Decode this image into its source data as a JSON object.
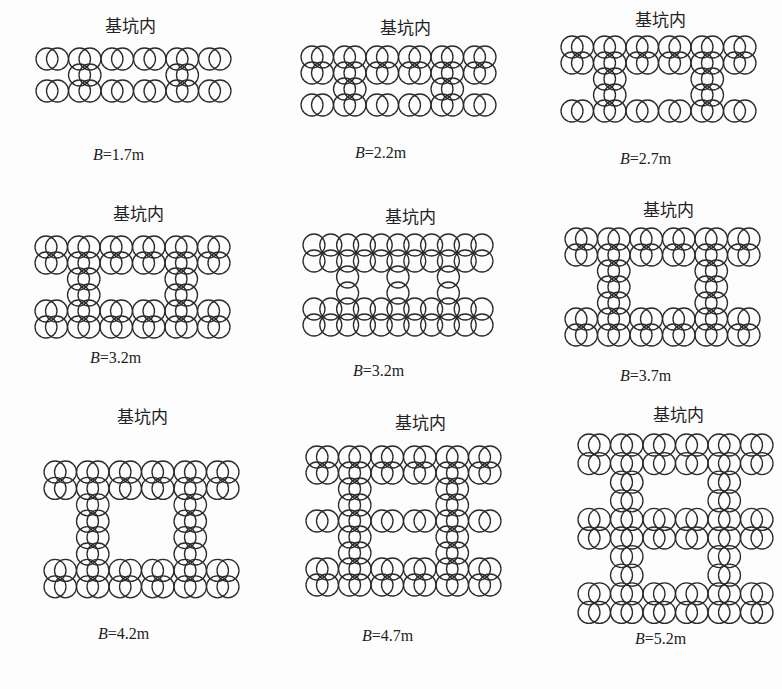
{
  "figure": {
    "inside_pit_label": "基坑内",
    "variable": "B",
    "panels": [
      {
        "id": "b17",
        "title": "基坑内",
        "title_pos": [
          130,
          16
        ],
        "b_value": "=1.7m",
        "label_pos": [
          93,
          146
        ],
        "layout": "horizontal",
        "origin": [
          35,
          47
        ],
        "row_step": 16,
        "rows": [
          "full",
          "conn",
          "full"
        ]
      },
      {
        "id": "b22",
        "title": "基坑内",
        "title_pos": [
          405,
          18
        ],
        "b_value": "=2.2m",
        "label_pos": [
          355,
          144
        ],
        "layout": "horizontal",
        "origin": [
          300,
          45
        ],
        "row_step": 16,
        "rows": [
          "full",
          "full",
          "conn",
          "full"
        ]
      },
      {
        "id": "b27",
        "title": "基坑内",
        "title_pos": [
          660,
          10
        ],
        "b_value": "=2.7m",
        "label_pos": [
          620,
          150
        ],
        "layout": "horizontal",
        "origin": [
          560,
          35
        ],
        "row_step": 16,
        "rows": [
          "full",
          "full",
          "conn",
          "conn",
          "full"
        ]
      },
      {
        "id": "b32a",
        "title": "基坑内",
        "title_pos": [
          138,
          204
        ],
        "b_value": "=3.2m",
        "label_pos": [
          90,
          349
        ],
        "layout": "horizontal",
        "origin": [
          34,
          235
        ],
        "row_step": 16,
        "rows": [
          "full",
          "full",
          "conn",
          "conn",
          "full",
          "full"
        ]
      },
      {
        "id": "b32b",
        "title": "基坑内",
        "title_pos": [
          410,
          207
        ],
        "b_value": "=3.2m",
        "label_pos": [
          353,
          362
        ],
        "layout": "vertical",
        "origin": [
          302,
          233
        ],
        "row_step": 16,
        "rows": [
          "full",
          "full",
          "conn",
          "conn",
          "full",
          "full"
        ]
      },
      {
        "id": "b37",
        "title": "基坑内",
        "title_pos": [
          668,
          200
        ],
        "b_value": "=3.7m",
        "label_pos": [
          620,
          367
        ],
        "layout": "horizontal",
        "origin": [
          564,
          227
        ],
        "row_step": 16,
        "rows": [
          "full",
          "full",
          "conn",
          "conn",
          "conn",
          "full",
          "full"
        ]
      },
      {
        "id": "b42",
        "title": "基坑内",
        "title_pos": [
          142,
          407
        ],
        "b_value": "=4.2m",
        "label_pos": [
          98,
          625
        ],
        "layout": "horizontal",
        "origin": [
          43,
          460
        ],
        "row_step": 16.4,
        "rows": [
          "full",
          "full",
          "conn",
          "conn",
          "conn",
          "conn",
          "full",
          "full"
        ]
      },
      {
        "id": "b47",
        "title": "基坑内",
        "title_pos": [
          420,
          413
        ],
        "b_value": "=4.7m",
        "label_pos": [
          362,
          627
        ],
        "layout": "horizontal",
        "origin": [
          305,
          445
        ],
        "row_step": 16,
        "rows": [
          "full",
          "full",
          "conn",
          "conn",
          "full",
          "conn",
          "conn",
          "full",
          "full"
        ]
      },
      {
        "id": "b52",
        "title": "基坑内",
        "title_pos": [
          678,
          405
        ],
        "b_value": "=5.2m",
        "label_pos": [
          635,
          630
        ],
        "layout": "horizontal",
        "origin": [
          577,
          433
        ],
        "row_step": 18.6,
        "rows": [
          "full",
          "full",
          "conn",
          "conn",
          "full",
          "full",
          "conn",
          "conn",
          "full",
          "full"
        ]
      }
    ],
    "geometry": {
      "circle_radius": 11,
      "horizontal": {
        "column_x": [
          11,
          21.5,
          43.5,
          54,
          76,
          86.5,
          108.5,
          119,
          141,
          151.5,
          173.5,
          184
        ],
        "conn_columns": [
          2,
          3,
          8,
          9
        ]
      },
      "vertical": {
        "column_x": [
          11,
          27.8,
          44.6,
          61.4,
          78.2,
          95,
          111.8,
          128.6,
          145.4,
          162.2,
          179
        ],
        "conn_columns": [
          2,
          5,
          8
        ]
      }
    },
    "stroke_color": "#2b2b2b"
  }
}
